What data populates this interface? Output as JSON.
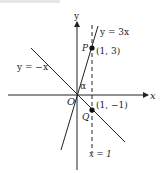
{
  "header_text": "ne Example 0.",
  "axes": {
    "x_label": "x",
    "y_label": "y",
    "origin_label": "O"
  },
  "lines": [
    {
      "name": "y=3x",
      "label": "y = 3x"
    },
    {
      "name": "y=-x",
      "label": "y = −x"
    },
    {
      "name": "x=1",
      "label": "x = 1",
      "style": "dashed"
    }
  ],
  "points": [
    {
      "name": "P",
      "label": "P",
      "coords": "(1, 3)"
    },
    {
      "name": "Q",
      "label": "Q",
      "coords": "(1, −1)"
    }
  ],
  "angle_label": "α",
  "colors": {
    "ink": "#222222",
    "background": "#ffffff"
  }
}
